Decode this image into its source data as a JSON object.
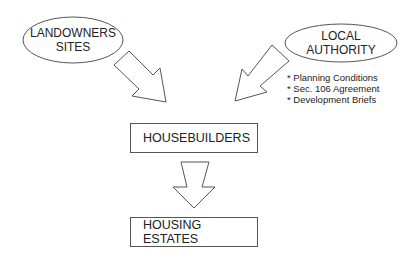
{
  "nodes": {
    "landowners": {
      "line1": "LANDOWNERS",
      "line2": "SITES"
    },
    "local_authority": {
      "line1": "LOCAL",
      "line2": "AUTHORITY"
    },
    "housebuilders": {
      "label": "HOUSEBUILDERS"
    },
    "housing_estates": {
      "label": "HOUSING ESTATES"
    }
  },
  "local_authority_instruments": [
    "* Planning Conditions",
    "* Sec. 106 Agreement",
    "* Development Briefs"
  ],
  "colors": {
    "stroke": "#555555",
    "background": "#ffffff",
    "text": "#222222"
  }
}
